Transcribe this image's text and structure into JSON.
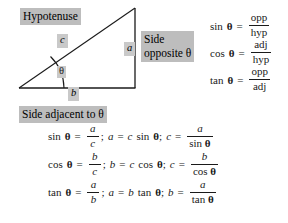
{
  "figure": {
    "background_color": "#ffffff",
    "text_color": "#1a1a1a",
    "highlight_color": "#bdbdbd",
    "highlight_small_color": "#c9c9c9",
    "line_color": "#1a1a1a"
  },
  "triangle": {
    "vertices": {
      "left": [
        19,
        88
      ],
      "bottom_right": [
        135,
        88
      ],
      "top_right": [
        135,
        8
      ]
    },
    "angle_arc_label": "θ",
    "side_labels": {
      "hypotenuse": "c",
      "opposite": "a",
      "adjacent": "b"
    }
  },
  "callouts": {
    "hypotenuse": "Hypotenuse",
    "side_opposite_line1": "Side",
    "side_opposite_line2": "opposite θ",
    "side_adjacent": "Side adjacent to θ"
  },
  "ratios": [
    {
      "fn": "sin",
      "angle": "θ",
      "eq": "=",
      "numerator": "opp",
      "denominator": "hyp"
    },
    {
      "fn": "cos",
      "angle": "θ",
      "eq": "=",
      "numerator": "adj",
      "denominator": "hyp"
    },
    {
      "fn": "tan",
      "angle": "θ",
      "eq": "=",
      "numerator": "opp",
      "denominator": "adj"
    }
  ],
  "identities": [
    {
      "fn": "sin",
      "angle": "θ",
      "eq": "=",
      "ratio_num": "a",
      "ratio_den": "c",
      "semicolon1": ";",
      "solve_var": "a",
      "solve_eq": "=",
      "solve_expr_var": "c",
      "solve_expr_fn": "sin",
      "solve_expr_angle": "θ",
      "semicolon2": ";",
      "final_var": "c",
      "final_eq": "=",
      "final_num": "a",
      "final_den_fn": "sin",
      "final_den_angle": "θ"
    },
    {
      "fn": "cos",
      "angle": "θ",
      "eq": "=",
      "ratio_num": "b",
      "ratio_den": "c",
      "semicolon1": ";",
      "solve_var": "b",
      "solve_eq": "=",
      "solve_expr_var": "c",
      "solve_expr_fn": "cos",
      "solve_expr_angle": "θ",
      "semicolon2": ";",
      "final_var": "c",
      "final_eq": "=",
      "final_num": "b",
      "final_den_fn": "cos",
      "final_den_angle": "θ"
    },
    {
      "fn": "tan",
      "angle": "θ",
      "eq": "=",
      "ratio_num": "a",
      "ratio_den": "b",
      "semicolon1": ";",
      "solve_var": "a",
      "solve_eq": "=",
      "solve_expr_var": "b",
      "solve_expr_fn": "tan",
      "solve_expr_angle": "θ",
      "semicolon2": ";",
      "final_var": "b",
      "final_eq": "=",
      "final_num": "a",
      "final_den_fn": "tan",
      "final_den_angle": "θ"
    }
  ]
}
